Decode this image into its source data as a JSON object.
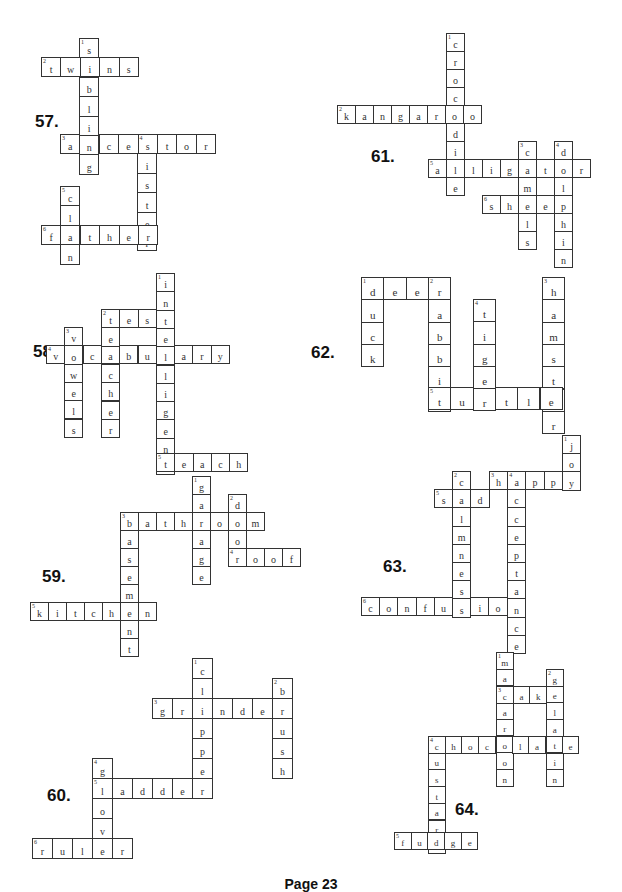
{
  "footer": "Page 23",
  "puzzles": [
    {
      "label": "57.",
      "label_x": 35,
      "label_y": 112,
      "cell": 19.4,
      "font": 10,
      "words": [
        {
          "num": "1",
          "dir": "down",
          "word": "sibling",
          "x": 79,
          "y": 38
        },
        {
          "num": "2",
          "dir": "across",
          "word": "twins",
          "x": 41,
          "y": 57
        },
        {
          "num": "3",
          "dir": "across",
          "word": "ancestor",
          "x": 60,
          "y": 134
        },
        {
          "num": "4",
          "dir": "down",
          "word": "sister",
          "x": 137,
          "y": 134
        },
        {
          "num": "5",
          "dir": "down",
          "word": "clan",
          "x": 60,
          "y": 186
        },
        {
          "num": "6",
          "dir": "across",
          "word": "father",
          "x": 41,
          "y": 225
        }
      ]
    },
    {
      "label": "61.",
      "label_x": 371,
      "label_y": 147,
      "cell": 18,
      "font": 10,
      "words": [
        {
          "num": "1",
          "dir": "down",
          "word": "crocodile",
          "x": 446,
          "y": 33
        },
        {
          "num": "2",
          "dir": "across",
          "word": "kangaroo",
          "x": 337,
          "y": 105
        },
        {
          "num": "3",
          "dir": "down",
          "word": "camels",
          "x": 518,
          "y": 141
        },
        {
          "num": "4",
          "dir": "down",
          "word": "dolphin",
          "x": 554,
          "y": 141
        },
        {
          "num": "5",
          "dir": "across",
          "word": "alligator",
          "x": 428,
          "y": 159
        },
        {
          "num": "6",
          "dir": "across",
          "word": "sheep",
          "x": 482,
          "y": 195
        }
      ]
    },
    {
      "label": "58",
      "label_x": 33,
      "label_y": 342,
      "cell": 18.3,
      "font": 10,
      "words": [
        {
          "num": "1",
          "dir": "down",
          "word": "intelligent",
          "x": 156,
          "y": 273
        },
        {
          "num": "2",
          "dir": "across",
          "word": "test",
          "x": 101,
          "y": 309
        },
        {
          "num": "3",
          "dir": "down",
          "word": "vowels",
          "x": 64,
          "y": 327
        },
        {
          "num": "4",
          "dir": "across",
          "word": "vocabulary",
          "x": 46,
          "y": 345
        },
        {
          "num": "",
          "dir": "down",
          "word": "teacher",
          "x": 101,
          "y": 309
        },
        {
          "num": "5",
          "dir": "across",
          "word": "teach",
          "x": 156,
          "y": 453
        }
      ]
    },
    {
      "label": "62.",
      "label_x": 311,
      "label_y": 343,
      "cell": 22.3,
      "font": 11,
      "words": [
        {
          "num": "1",
          "dir": "across",
          "word": "deer",
          "x": 361,
          "y": 277
        },
        {
          "num": "",
          "dir": "down",
          "word": "duck",
          "x": 361,
          "y": 277
        },
        {
          "num": "2",
          "dir": "down",
          "word": "rabbit",
          "x": 428,
          "y": 277
        },
        {
          "num": "3",
          "dir": "down",
          "word": "hamster",
          "x": 542,
          "y": 277
        },
        {
          "num": "4",
          "dir": "down",
          "word": "tiger",
          "x": 473,
          "y": 299
        },
        {
          "num": "5",
          "dir": "across",
          "word": "turtle",
          "x": 428,
          "y": 387
        }
      ]
    },
    {
      "label": "59.",
      "label_x": 42,
      "label_y": 567,
      "cell": 18,
      "font": 10,
      "words": [
        {
          "num": "1",
          "dir": "down",
          "word": "garage",
          "x": 192,
          "y": 476
        },
        {
          "num": "2",
          "dir": "down",
          "word": "door",
          "x": 228,
          "y": 494
        },
        {
          "num": "3",
          "dir": "across",
          "word": "bathroom",
          "x": 120,
          "y": 512
        },
        {
          "num": "",
          "dir": "down",
          "word": "basement",
          "x": 120,
          "y": 512
        },
        {
          "num": "4",
          "dir": "across",
          "word": "roof",
          "x": 228,
          "y": 548
        },
        {
          "num": "5",
          "dir": "across",
          "word": "kitchen",
          "x": 30,
          "y": 602
        }
      ]
    },
    {
      "label": "63.",
      "label_x": 383,
      "label_y": 557,
      "cell": 18.2,
      "font": 10,
      "words": [
        {
          "num": "1",
          "dir": "down",
          "word": "joy",
          "x": 562,
          "y": 435
        },
        {
          "num": "2",
          "dir": "down",
          "word": "calmness",
          "x": 452,
          "y": 471
        },
        {
          "num": "3",
          "dir": "across",
          "word": "happy",
          "x": 489,
          "y": 471
        },
        {
          "num": "4",
          "dir": "down",
          "word": "acceptance",
          "x": 507,
          "y": 471
        },
        {
          "num": "5",
          "dir": "across",
          "word": "sad",
          "x": 434,
          "y": 489
        },
        {
          "num": "6",
          "dir": "across",
          "word": "confusion",
          "x": 361,
          "y": 597
        }
      ]
    },
    {
      "label": "60.",
      "label_x": 47,
      "label_y": 786,
      "cell": 20,
      "font": 10,
      "words": [
        {
          "num": "1",
          "dir": "down",
          "word": "clipper",
          "x": 192,
          "y": 658
        },
        {
          "num": "2",
          "dir": "down",
          "word": "brush",
          "x": 272,
          "y": 678
        },
        {
          "num": "3",
          "dir": "across",
          "word": "grinder",
          "x": 152,
          "y": 698
        },
        {
          "num": "4",
          "dir": "down",
          "word": "glove",
          "x": 92,
          "y": 758
        },
        {
          "num": "5",
          "dir": "across",
          "word": "ladder",
          "x": 92,
          "y": 778
        },
        {
          "num": "6",
          "dir": "across",
          "word": "ruler",
          "x": 32,
          "y": 838
        }
      ]
    },
    {
      "label": "64.",
      "label_x": 455,
      "label_y": 800,
      "cell": 16.7,
      "font": 9,
      "words": [
        {
          "num": "1",
          "dir": "down",
          "word": "macaroon",
          "x": 496,
          "y": 652
        },
        {
          "num": "2",
          "dir": "down",
          "word": "gelatin",
          "x": 546,
          "y": 669
        },
        {
          "num": "3",
          "dir": "across",
          "word": "cake",
          "x": 496,
          "y": 686
        },
        {
          "num": "4",
          "dir": "across",
          "word": "chocolate",
          "x": 428,
          "y": 736
        },
        {
          "num": "",
          "dir": "down",
          "word": "custard",
          "x": 428,
          "y": 736
        },
        {
          "num": "5",
          "dir": "across",
          "word": "fudge",
          "x": 394,
          "y": 832
        }
      ]
    }
  ]
}
